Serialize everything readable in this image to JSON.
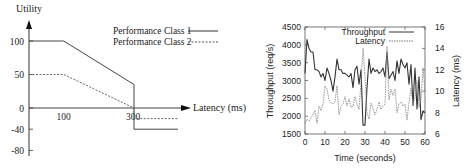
{
  "chart_data": [
    {
      "type": "line",
      "title": "",
      "xlabel": "Latency (ms)",
      "ylabel": "Utility",
      "xticks": [
        100,
        300
      ],
      "yticks": [
        100,
        50,
        0,
        -40,
        -80
      ],
      "legend": {
        "position": "top-right",
        "entries": [
          "Performance Class 1",
          "Performance Class 2"
        ]
      },
      "series": [
        {
          "name": "Performance Class 1",
          "style": "solid",
          "points": [
            [
              0,
              100
            ],
            [
              100,
              100
            ],
            [
              300,
              35
            ],
            [
              300,
              -40
            ],
            [
              350,
              -40
            ]
          ]
        },
        {
          "name": "Performance Class 2",
          "style": "dashed",
          "points": [
            [
              0,
              50
            ],
            [
              100,
              50
            ],
            [
              300,
              0
            ],
            [
              300,
              -20
            ],
            [
              350,
              -20
            ]
          ]
        }
      ]
    },
    {
      "type": "line",
      "title": "",
      "xlabel": "Time (seconds)",
      "ylabel": "Throughput (req/s)",
      "y2label": "Latency (ms)",
      "xlim": [
        0,
        60
      ],
      "ylim": [
        1500,
        4500
      ],
      "y2lim": [
        6,
        16
      ],
      "xticks": [
        0,
        10,
        20,
        30,
        40,
        50,
        60
      ],
      "yticks": [
        1500,
        2000,
        2500,
        3000,
        3500,
        4000,
        4500
      ],
      "y2ticks": [
        6,
        8,
        10,
        12,
        14,
        16
      ],
      "legend": {
        "position": "top-right",
        "entries": [
          "Throughput",
          "Latency"
        ]
      },
      "grid": false,
      "series": [
        {
          "name": "Throughput",
          "axis": "left",
          "style": "solid",
          "x": [
            0,
            1,
            2,
            3,
            4,
            5,
            6,
            7,
            8,
            9,
            10,
            11,
            12,
            13,
            14,
            15,
            16,
            17,
            18,
            19,
            20,
            21,
            22,
            23,
            24,
            25,
            26,
            27,
            28,
            29,
            30,
            31,
            32,
            33,
            34,
            35,
            36,
            37,
            38,
            39,
            40,
            41,
            42,
            43,
            44,
            45,
            46,
            47,
            48,
            49,
            50,
            51,
            52,
            53,
            54,
            55,
            56,
            57,
            58,
            59,
            60
          ],
          "values": [
            3200,
            4150,
            3900,
            3800,
            3800,
            3300,
            3300,
            3250,
            3100,
            3200,
            3000,
            3350,
            3200,
            3000,
            2700,
            3100,
            3600,
            3300,
            3300,
            3200,
            3200,
            3150,
            3100,
            3200,
            2800,
            3300,
            3400,
            2900,
            3300,
            1750,
            1750,
            2800,
            3600,
            3200,
            3350,
            3250,
            3300,
            3200,
            3250,
            3350,
            3100,
            3800,
            3050,
            3150,
            3250,
            3000,
            3550,
            3200,
            3600,
            3450,
            3350,
            3500,
            2900,
            3450,
            2300,
            3350,
            2200,
            3100,
            1900,
            2150,
            2100
          ]
        },
        {
          "name": "Latency",
          "axis": "right",
          "style": "dashed",
          "x": [
            0,
            1,
            2,
            3,
            4,
            5,
            6,
            7,
            8,
            9,
            10,
            11,
            12,
            13,
            14,
            15,
            16,
            17,
            18,
            19,
            20,
            21,
            22,
            23,
            24,
            25,
            26,
            27,
            28,
            29,
            30,
            31,
            32,
            33,
            34,
            35,
            36,
            37,
            38,
            39,
            40,
            41,
            42,
            43,
            44,
            45,
            46,
            47,
            48,
            49,
            50,
            51,
            52,
            53,
            54,
            55,
            56,
            57,
            58,
            59,
            60
          ],
          "values": [
            7.0,
            7.4,
            7.2,
            7.5,
            7.8,
            8.2,
            7.0,
            8.6,
            8.2,
            8.8,
            10.5,
            10.2,
            9.2,
            8.9,
            8.8,
            9.0,
            10.5,
            7.8,
            8.6,
            8.8,
            9.5,
            8.6,
            9.3,
            8.5,
            8.6,
            9.5,
            8.8,
            8.3,
            10.8,
            14.0,
            11.5,
            8.0,
            7.4,
            8.9,
            8.4,
            7.8,
            8.3,
            9.0,
            8.3,
            8.6,
            8.8,
            14.2,
            9.2,
            10.2,
            9.6,
            10.2,
            8.0,
            8.8,
            9.0,
            8.6,
            8.8,
            7.3,
            8.9,
            10.3,
            8.8,
            9.4,
            11.0,
            8.5,
            9.2,
            12.2,
            10.0
          ]
        }
      ]
    }
  ],
  "left_chart": {
    "ylabel": "Utility",
    "xlabel": "Latency (ms)",
    "legend_1": "Performance Class 1",
    "legend_2": "Performance Class 2",
    "ytick_labels": [
      "100",
      "50",
      "0",
      "-40",
      "-80"
    ],
    "xtick_labels": [
      "100",
      "300"
    ]
  },
  "right_chart": {
    "ylabel": "Throughput (req/s)",
    "y2label": "Latency (ms)",
    "xlabel": "Time (seconds)",
    "legend_1": "Throughput",
    "legend_2": "Latency"
  }
}
